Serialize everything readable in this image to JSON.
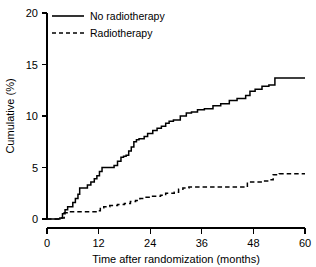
{
  "chart_data": {
    "type": "line",
    "title": "",
    "subtitle": "",
    "xlabel": "Time after randomization (months)",
    "ylabel": "Cumulative (%)",
    "xlim": [
      0,
      60
    ],
    "ylim": [
      0,
      20
    ],
    "xticks": [
      0,
      12,
      24,
      36,
      48,
      60
    ],
    "xticklabels": [
      "0",
      "12",
      "24",
      "36",
      "48",
      "60"
    ],
    "yticks": [
      0,
      5,
      10,
      15,
      20
    ],
    "yticklabels": [
      "0",
      "5",
      "10",
      "15",
      "20"
    ],
    "grid": false,
    "legend_position": "upper-left",
    "line_color": "#000000",
    "background_color": "#ffffff",
    "step_type": "post",
    "series": [
      {
        "name": "No radiotherapy",
        "style": "solid",
        "x": [
          0,
          3.0,
          3.6,
          4.2,
          4.8,
          5.4,
          6.0,
          6.6,
          7.2,
          7.6,
          8.2,
          9.4,
          10.2,
          11.0,
          11.6,
          12.2,
          12.8,
          13.4,
          15.6,
          16.4,
          17.2,
          17.8,
          18.4,
          19.0,
          19.6,
          20.2,
          20.8,
          21.4,
          22.0,
          22.6,
          23.4,
          24.6,
          25.6,
          26.6,
          27.6,
          28.4,
          29.4,
          31.0,
          32.4,
          33.6,
          35.0,
          36.6,
          38.6,
          40.4,
          42.4,
          44.2,
          46.2,
          47.2,
          48.4,
          50.0,
          51.6,
          53.0,
          54.4,
          60
        ],
        "y": [
          0,
          0.1,
          0.5,
          0.9,
          1.2,
          1.2,
          1.6,
          2.0,
          2.4,
          3.0,
          3.0,
          3.3,
          3.6,
          3.9,
          4.2,
          4.6,
          5.0,
          5.0,
          5.2,
          5.6,
          6.0,
          6.1,
          6.2,
          6.6,
          7.0,
          7.5,
          7.7,
          7.8,
          7.8,
          8.0,
          8.3,
          8.6,
          8.8,
          9.0,
          9.3,
          9.5,
          9.6,
          10.0,
          10.3,
          10.4,
          10.6,
          10.7,
          11.0,
          11.2,
          11.5,
          11.7,
          12.0,
          12.4,
          12.6,
          12.9,
          13.0,
          13.7,
          13.7,
          13.7
        ],
        "final_value": 13.7
      },
      {
        "name": "Radiotherapy",
        "style": "dashed",
        "x": [
          0,
          3.2,
          4.0,
          5.0,
          6.4,
          8.0,
          10.0,
          11.4,
          12.4,
          13.2,
          14.6,
          16.4,
          18.0,
          19.4,
          20.6,
          21.6,
          22.6,
          24.0,
          25.4,
          26.4,
          27.6,
          28.6,
          29.6,
          30.6,
          31.6,
          33.0,
          38.0,
          42.0,
          45.6,
          46.6,
          48.0,
          50.0,
          51.6,
          52.6,
          54.0,
          60
        ],
        "y": [
          0,
          0.1,
          0.6,
          0.7,
          0.7,
          0.7,
          0.7,
          0.8,
          1.1,
          1.2,
          1.3,
          1.4,
          1.5,
          1.7,
          1.8,
          2.0,
          2.1,
          2.2,
          2.2,
          2.3,
          2.5,
          2.5,
          2.6,
          2.9,
          3.0,
          3.1,
          3.1,
          3.1,
          3.1,
          3.6,
          3.6,
          3.7,
          3.8,
          4.3,
          4.4,
          4.4
        ],
        "final_value": 4.4
      }
    ]
  },
  "legend": {
    "items": [
      {
        "label": "No radiotherapy",
        "style": "solid"
      },
      {
        "label": "Radiotherapy",
        "style": "dashed"
      }
    ]
  },
  "axes": {
    "x_title": "Time after randomization (months)",
    "y_title": "Cumulative (%)"
  }
}
